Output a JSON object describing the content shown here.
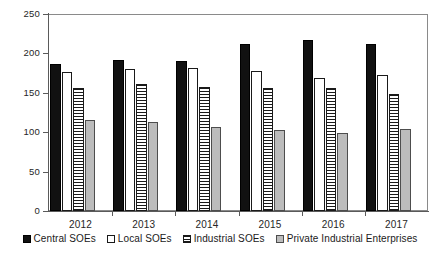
{
  "chart_data": {
    "type": "bar",
    "title": "",
    "xlabel": "",
    "ylabel": "",
    "categories": [
      "2012",
      "2013",
      "2014",
      "2015",
      "2016",
      "2017"
    ],
    "ylim": [
      0,
      250
    ],
    "yticks": [
      0,
      50,
      100,
      150,
      200,
      250
    ],
    "ytick_labels": [
      "0",
      "50",
      "100",
      "150",
      "200",
      "250"
    ],
    "grid": false,
    "legend_position": "bottom",
    "series": [
      {
        "name": "Central SOEs",
        "style": "solid-black",
        "color": "#111111",
        "values": [
          186,
          192,
          190,
          212,
          217,
          212
        ]
      },
      {
        "name": "Local SOEs",
        "style": "open-white",
        "color": "#ffffff",
        "values": [
          176,
          180,
          182,
          178,
          169,
          173
        ]
      },
      {
        "name": "Industrial SOEs",
        "style": "horizontal-hatch",
        "color": "#ffffff",
        "values": [
          156,
          161,
          158,
          156,
          156,
          148
        ]
      },
      {
        "name": "Private Industrial Enterprises",
        "style": "solid-gray",
        "color": "#bcbcbc",
        "values": [
          116,
          113,
          106,
          103,
          99,
          104
        ]
      }
    ]
  },
  "legend": {
    "items": [
      {
        "label": "Central SOEs",
        "swatch": "legend-swatch-central"
      },
      {
        "label": "Local SOEs",
        "swatch": "legend-swatch-local"
      },
      {
        "label": "Industrial SOEs",
        "swatch": "legend-swatch-industrial"
      },
      {
        "label": "Private Industrial Enterprises",
        "swatch": "legend-swatch-private"
      }
    ]
  }
}
